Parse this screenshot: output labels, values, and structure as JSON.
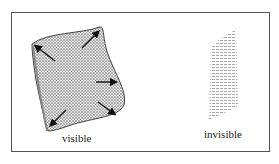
{
  "figure": {
    "type": "diagram",
    "panels": [
      {
        "id": "visible",
        "label": "visible",
        "arrows": 5,
        "description": "textured sheet with outward arrows"
      },
      {
        "id": "invisible",
        "label": "invisible",
        "description": "faint dashed-pattern sheet"
      }
    ],
    "colors": {
      "frame": "#555555",
      "texture_fill": "#d8d8d8",
      "arrow": "#111111",
      "invisible_fill": "#bbbbbb"
    }
  }
}
